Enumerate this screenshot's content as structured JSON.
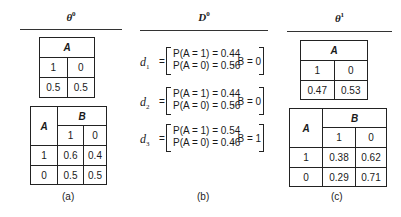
{
  "panels": {
    "a": {
      "header": {
        "symbol": "θ",
        "superscript": "0"
      },
      "caption": "(a)",
      "table_a": {
        "title": "A",
        "columns": [
          "1",
          "0"
        ],
        "values": [
          "0.5",
          "0.5"
        ]
      },
      "table_ab": {
        "row_header": "A",
        "col_header": "B",
        "columns": [
          "1",
          "0"
        ],
        "rows": [
          {
            "label": "1",
            "values": [
              "0.6",
              "0.4"
            ]
          },
          {
            "label": "0",
            "values": [
              "0.5",
              "0.5"
            ]
          }
        ]
      }
    },
    "b": {
      "header": {
        "symbol": "D",
        "superscript": "0"
      },
      "caption": "(b)",
      "data_points": [
        {
          "name": "d",
          "sub": "1",
          "eq": "=",
          "line1": "P(A = 1) = 0.44",
          "line2": "P(A = 0) = 0.56",
          "b_value": ", B = 0"
        },
        {
          "name": "d",
          "sub": "2",
          "eq": "=",
          "line1": "P(A = 1) = 0.44",
          "line2": "P(A = 0) = 0.56",
          "b_value": ", B = 0"
        },
        {
          "name": "d",
          "sub": "3",
          "eq": "=",
          "line1": "P(A = 1) = 0.54",
          "line2": "P(A = 0) = 0.46",
          "b_value": ", B = 1"
        }
      ]
    },
    "c": {
      "header": {
        "symbol": "θ",
        "superscript": "1"
      },
      "caption": "(c)",
      "table_a": {
        "title": "A",
        "columns": [
          "1",
          "0"
        ],
        "values": [
          "0.47",
          "0.53"
        ]
      },
      "table_ab": {
        "row_header": "A",
        "col_header": "B",
        "columns": [
          "1",
          "0"
        ],
        "rows": [
          {
            "label": "1",
            "values": [
              "0.38",
              "0.62"
            ]
          },
          {
            "label": "0",
            "values": [
              "0.29",
              "0.71"
            ]
          }
        ]
      }
    }
  }
}
